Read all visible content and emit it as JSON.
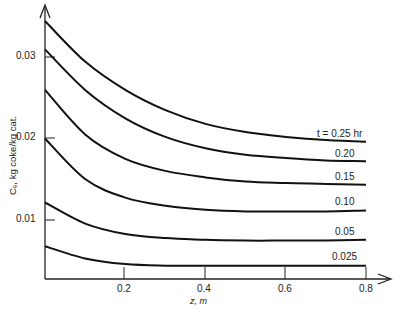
{
  "chart_data": {
    "type": "line",
    "title": "",
    "xlabel": "z, m",
    "ylabel": "C_c, kg coke/kg cat.",
    "xlim": [
      0,
      0.8
    ],
    "ylim": [
      0.003,
      0.035
    ],
    "grid": false,
    "x_ticks": [
      "0.2",
      "0.4",
      "0.6",
      "0.8"
    ],
    "y_ticks": [
      "0.01",
      "0.02",
      "0.03"
    ],
    "x": [
      0,
      0.1,
      0.2,
      0.3,
      0.4,
      0.5,
      0.6,
      0.7,
      0.8
    ],
    "series": [
      {
        "name": "t = 0.25 hr",
        "label": "t = 0.25 hr",
        "values": [
          0.0345,
          0.0295,
          0.026,
          0.0235,
          0.0218,
          0.0208,
          0.0202,
          0.0198,
          0.0196
        ]
      },
      {
        "name": "0.20",
        "label": "0.20",
        "values": [
          0.031,
          0.026,
          0.0225,
          0.0202,
          0.0188,
          0.018,
          0.0176,
          0.0173,
          0.0172
        ]
      },
      {
        "name": "0.15",
        "label": "0.15",
        "values": [
          0.026,
          0.0205,
          0.0175,
          0.016,
          0.0152,
          0.0147,
          0.0145,
          0.0144,
          0.0143
        ]
      },
      {
        "name": "0.10",
        "label": "0.10",
        "values": [
          0.02,
          0.015,
          0.0127,
          0.0117,
          0.0112,
          0.011,
          0.011,
          0.011,
          0.0111
        ]
      },
      {
        "name": "0.05",
        "label": "0.05",
        "values": [
          0.0121,
          0.0095,
          0.0082,
          0.0077,
          0.0075,
          0.0074,
          0.0074,
          0.0074,
          0.0075
        ]
      },
      {
        "name": "0.025",
        "label": "0.025",
        "values": [
          0.0067,
          0.0052,
          0.0045,
          0.0043,
          0.0043,
          0.0043,
          0.0043,
          0.0043,
          0.0043
        ]
      }
    ],
    "legend_position": "inline-right"
  },
  "axes": {
    "xlabel": "z, m",
    "ylabel": "Cₑ, kg coke/kg cat.",
    "x_ticks": [
      "0.2",
      "0.4",
      "0.6",
      "0.8"
    ],
    "y_ticks": [
      "0.01",
      "0.02",
      "0.03"
    ]
  },
  "labels": [
    "t = 0.25 hr",
    "0.20",
    "0.15",
    "0.10",
    "0.05",
    "0.025"
  ],
  "colors": {
    "line": "#111111",
    "axis": "#222222",
    "background": "#ffffff"
  }
}
